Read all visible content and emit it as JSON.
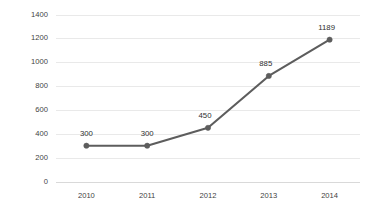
{
  "chart_data": {
    "type": "line",
    "title": "",
    "subtitle": "",
    "xlabel": "",
    "ylabel": "",
    "categories": [
      "2010",
      "2011",
      "2012",
      "2013",
      "2014"
    ],
    "values": [
      300,
      300,
      450,
      885,
      1189
    ],
    "point_labels": [
      "300",
      "300",
      "450",
      "885",
      "1189"
    ],
    "ylim": [
      0,
      1400
    ],
    "ytick_labels": [
      "0",
      "200",
      "400",
      "600",
      "800",
      "1000",
      "1200",
      "1400"
    ],
    "ytick_values": [
      0,
      200,
      400,
      600,
      800,
      1000,
      1200,
      1400
    ],
    "grid": "horizontal",
    "legend": "none",
    "series": [
      {
        "name": "",
        "values": [
          300,
          300,
          450,
          885,
          1189
        ]
      }
    ],
    "colors": {
      "line": "#5d5d5d",
      "marker": "#5d5d5d",
      "gridline": "#e9e9e9",
      "axis": "#d9d9d9",
      "tick_text": "#3f3f3f",
      "label_text": "#303030",
      "background": "#ffffff"
    }
  }
}
